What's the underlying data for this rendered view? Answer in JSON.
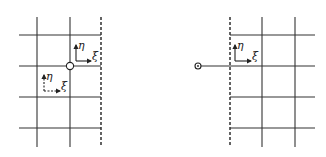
{
  "figure": {
    "panels": [
      {
        "id": "left",
        "description": "Grid with dashed boundary on the right; open node at interior grid intersection",
        "frames": [
          {
            "eta_label": "η",
            "xi_label": "ξ",
            "style": "solid"
          },
          {
            "eta_label": "η",
            "xi_label": "ξ",
            "style": "dashed"
          }
        ]
      },
      {
        "id": "right",
        "description": "Grid with dashed boundary on the left; small node outside the boundary connected by line",
        "frames": [
          {
            "eta_label": "η",
            "xi_label": "ξ",
            "style": "solid"
          }
        ]
      }
    ],
    "colors": {
      "line": "#333333",
      "background": "#ffffff"
    }
  }
}
